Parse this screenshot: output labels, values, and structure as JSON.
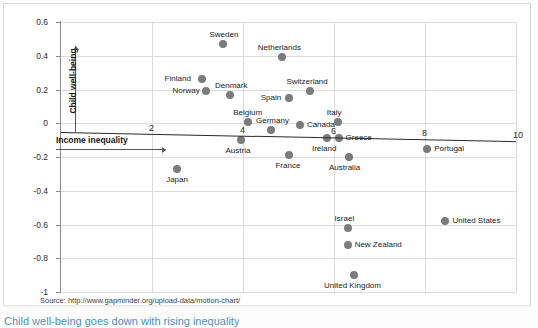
{
  "source": {
    "text": "Source: http://www.gapminder.org/upload-data/motion-chart/"
  },
  "caption": {
    "text": "Child well-being goes down with rising inequality"
  },
  "chart_data": {
    "type": "scatter",
    "title": "",
    "subtitle": "",
    "xlabel": "Income inequality",
    "ylabel": "Child well-being",
    "xlim": [
      0,
      10
    ],
    "ylim": [
      -1,
      0.6
    ],
    "xticks": [
      2,
      4,
      6,
      8,
      10
    ],
    "xtick_labels": [
      "2",
      "4",
      "6",
      "8",
      "10"
    ],
    "yticks": [
      0.6,
      0.4,
      0.2,
      0,
      -0.2,
      -0.4,
      -0.6,
      -0.8,
      -1
    ],
    "ytick_labels": [
      "0.6",
      "0.4",
      "0.2",
      "0",
      "-0.2",
      "-0.4",
      "-0.6",
      "-0.8",
      "-1"
    ],
    "grid": true,
    "legend": "none",
    "marker_color": "#7b7b7b",
    "trendline": {
      "visible": true,
      "color": "#2a2a2a",
      "y_at_xmin": 0.0,
      "y_at_xmax": -0.055
    },
    "points": [
      {
        "label": "Sweden",
        "x": 3.55,
        "y": 0.47,
        "label_pos": "top"
      },
      {
        "label": "Netherlands",
        "x": 4.85,
        "y": 0.39,
        "label_pos": "top"
      },
      {
        "label": "Finland",
        "x": 3.1,
        "y": 0.26,
        "label_pos": "left"
      },
      {
        "label": "Norway",
        "x": 3.18,
        "y": 0.19,
        "label_pos": "left"
      },
      {
        "label": "Denmark",
        "x": 3.72,
        "y": 0.17,
        "label_pos": "top"
      },
      {
        "label": "Switzerland",
        "x": 5.48,
        "y": 0.19,
        "label_pos": "top"
      },
      {
        "label": "Spain",
        "x": 5.02,
        "y": 0.15,
        "label_pos": "left"
      },
      {
        "label": "Belgium",
        "x": 4.12,
        "y": 0.01,
        "label_pos": "top"
      },
      {
        "label": "Germany",
        "x": 4.62,
        "y": -0.04,
        "label_pos": "top"
      },
      {
        "label": "Canada",
        "x": 5.25,
        "y": -0.01,
        "label_pos": "right"
      },
      {
        "label": "Italy",
        "x": 6.08,
        "y": 0.01,
        "label_pos": "top"
      },
      {
        "label": "Greece",
        "x": 6.1,
        "y": -0.09,
        "label_pos": "right"
      },
      {
        "label": "Ireland",
        "x": 5.85,
        "y": -0.09,
        "label_pos": "bottom"
      },
      {
        "label": "Austria",
        "x": 3.95,
        "y": -0.1,
        "label_pos": "bottom"
      },
      {
        "label": "Portugal",
        "x": 8.05,
        "y": -0.15,
        "label_pos": "right"
      },
      {
        "label": "France",
        "x": 5.0,
        "y": -0.19,
        "label_pos": "bottom"
      },
      {
        "label": "Australia",
        "x": 6.32,
        "y": -0.2,
        "label_pos": "bottom"
      },
      {
        "label": "Japan",
        "x": 2.55,
        "y": -0.27,
        "label_pos": "bottom"
      },
      {
        "label": "Israel",
        "x": 6.3,
        "y": -0.62,
        "label_pos": "top"
      },
      {
        "label": "United States",
        "x": 8.45,
        "y": -0.58,
        "label_pos": "right"
      },
      {
        "label": "New Zealand",
        "x": 6.3,
        "y": -0.72,
        "label_pos": "right"
      },
      {
        "label": "United Kingdom",
        "x": 6.45,
        "y": -0.9,
        "label_pos": "bottom"
      }
    ]
  }
}
